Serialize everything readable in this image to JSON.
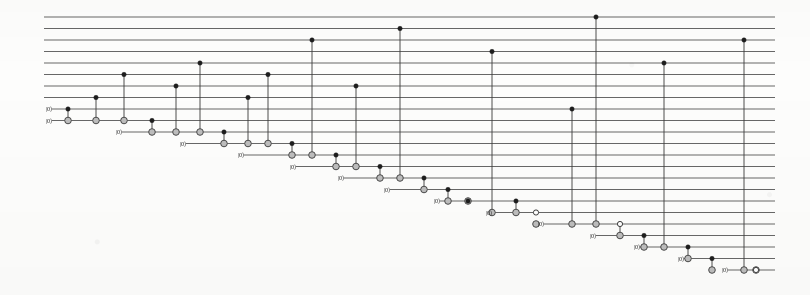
{
  "figure": {
    "kind": "quantum-circuit-diagram",
    "title": "",
    "background_color": "#fdfdfc",
    "ink_color": "#3a3a3a",
    "wire_color": "#4c4c4c",
    "target_fill": "#bdbdbd",
    "control_fill": "#1d1d1d"
  },
  "layout": {
    "width": 810,
    "height": 295,
    "wire_count": 23,
    "wire_x_start": 44,
    "wire_x_end": 775,
    "wire_y_top": 17,
    "wire_spacing": 11.5,
    "ket_label": "|0⟩",
    "ket_font_size": 6.2
  },
  "chart_data": {
    "type": "diagram",
    "title": "",
    "xlabel": "",
    "ylabel": "",
    "wires": [
      {
        "index": 0,
        "y": 17.0,
        "x_start": 44,
        "label": ""
      },
      {
        "index": 1,
        "y": 28.5,
        "x_start": 44,
        "label": ""
      },
      {
        "index": 2,
        "y": 40.0,
        "x_start": 44,
        "label": ""
      },
      {
        "index": 3,
        "y": 51.5,
        "x_start": 44,
        "label": ""
      },
      {
        "index": 4,
        "y": 63.0,
        "x_start": 44,
        "label": ""
      },
      {
        "index": 5,
        "y": 74.5,
        "x_start": 44,
        "label": ""
      },
      {
        "index": 6,
        "y": 86.0,
        "x_start": 44,
        "label": ""
      },
      {
        "index": 7,
        "y": 97.5,
        "x_start": 44,
        "label": ""
      },
      {
        "index": 8,
        "y": 109.0,
        "x_start": 52,
        "label": "|0⟩"
      },
      {
        "index": 9,
        "y": 120.5,
        "x_start": 52,
        "label": "|0⟩"
      },
      {
        "index": 10,
        "y": 132.0,
        "x_start": 122,
        "label": "|0⟩"
      },
      {
        "index": 11,
        "y": 143.5,
        "x_start": 186,
        "label": "|0⟩"
      },
      {
        "index": 12,
        "y": 155.0,
        "x_start": 244,
        "label": "|0⟩"
      },
      {
        "index": 13,
        "y": 166.5,
        "x_start": 296,
        "label": "|0⟩"
      },
      {
        "index": 14,
        "y": 178.0,
        "x_start": 344,
        "label": "|0⟩"
      },
      {
        "index": 15,
        "y": 189.5,
        "x_start": 390,
        "label": "|0⟩"
      },
      {
        "index": 16,
        "y": 201.0,
        "x_start": 440,
        "label": "|0⟩"
      },
      {
        "index": 17,
        "y": 212.5,
        "x_start": 492,
        "label": "|0⟩"
      },
      {
        "index": 18,
        "y": 224.0,
        "x_start": 544,
        "label": "|0⟩"
      },
      {
        "index": 19,
        "y": 235.5,
        "x_start": 596,
        "label": "|0⟩"
      },
      {
        "index": 20,
        "y": 247.0,
        "x_start": 640,
        "label": "|0⟩"
      },
      {
        "index": 21,
        "y": 258.5,
        "x_start": 684,
        "label": "|0⟩"
      },
      {
        "index": 22,
        "y": 270.0,
        "x_start": 728,
        "label": "|0⟩"
      }
    ],
    "gates": [
      {
        "x": 68,
        "controls": [
          {
            "wire": 8,
            "type": "filled"
          }
        ],
        "target": 9
      },
      {
        "x": 96,
        "controls": [
          {
            "wire": 7,
            "type": "filled"
          }
        ],
        "target": 9
      },
      {
        "x": 124,
        "controls": [
          {
            "wire": 5,
            "type": "filled"
          }
        ],
        "target": 9
      },
      {
        "x": 152,
        "controls": [
          {
            "wire": 9,
            "type": "filled"
          }
        ],
        "target": 10
      },
      {
        "x": 176,
        "controls": [
          {
            "wire": 6,
            "type": "filled"
          }
        ],
        "target": 10
      },
      {
        "x": 200,
        "controls": [
          {
            "wire": 4,
            "type": "filled"
          }
        ],
        "target": 10
      },
      {
        "x": 224,
        "controls": [
          {
            "wire": 10,
            "type": "filled"
          }
        ],
        "target": 11
      },
      {
        "x": 248,
        "controls": [
          {
            "wire": 7,
            "type": "filled"
          }
        ],
        "target": 11
      },
      {
        "x": 268,
        "controls": [
          {
            "wire": 5,
            "type": "filled"
          }
        ],
        "target": 11
      },
      {
        "x": 292,
        "controls": [
          {
            "wire": 11,
            "type": "filled"
          }
        ],
        "target": 12
      },
      {
        "x": 312,
        "controls": [
          {
            "wire": 2,
            "type": "filled"
          }
        ],
        "target": 12
      },
      {
        "x": 336,
        "controls": [
          {
            "wire": 12,
            "type": "filled"
          }
        ],
        "target": 13
      },
      {
        "x": 356,
        "controls": [
          {
            "wire": 6,
            "type": "filled"
          }
        ],
        "target": 13
      },
      {
        "x": 380,
        "controls": [
          {
            "wire": 13,
            "type": "filled"
          }
        ],
        "target": 14
      },
      {
        "x": 400,
        "controls": [
          {
            "wire": 1,
            "type": "filled"
          }
        ],
        "target": 14
      },
      {
        "x": 424,
        "controls": [
          {
            "wire": 14,
            "type": "filled"
          }
        ],
        "target": 15
      },
      {
        "x": 448,
        "controls": [
          {
            "wire": 15,
            "type": "filled"
          }
        ],
        "target": 16
      },
      {
        "x": 468,
        "controls": [
          {
            "wire": 16,
            "type": "filled"
          }
        ],
        "target": 16
      },
      {
        "x": 492,
        "controls": [
          {
            "wire": 3,
            "type": "filled"
          }
        ],
        "target": 17
      },
      {
        "x": 516,
        "controls": [
          {
            "wire": 16,
            "type": "filled"
          }
        ],
        "target": 17
      },
      {
        "x": 536,
        "controls": [
          {
            "wire": 17,
            "type": "open"
          }
        ],
        "target": 17
      },
      {
        "x": 572,
        "controls": [
          {
            "wire": 8,
            "type": "filled"
          }
        ],
        "target": 18
      },
      {
        "x": 572,
        "controls": [
          {
            "wire": 18,
            "type": "filled"
          }
        ],
        "target": 18
      },
      {
        "x": 596,
        "controls": [
          {
            "wire": 0,
            "type": "filled"
          }
        ],
        "target": 18
      },
      {
        "x": 620,
        "controls": [
          {
            "wire": 18,
            "type": "open"
          }
        ],
        "target": 19
      },
      {
        "x": 644,
        "controls": [
          {
            "wire": 19,
            "type": "filled"
          }
        ],
        "target": 20
      },
      {
        "x": 664,
        "controls": [
          {
            "wire": 4,
            "type": "filled"
          }
        ],
        "target": 20
      },
      {
        "x": 688,
        "controls": [
          {
            "wire": 20,
            "type": "filled"
          }
        ],
        "target": 21
      },
      {
        "x": 712,
        "controls": [
          {
            "wire": 21,
            "type": "filled"
          }
        ],
        "target": 22
      },
      {
        "x": 744,
        "controls": [
          {
            "wire": 2,
            "type": "filled"
          }
        ],
        "target": 22
      },
      {
        "x": 756,
        "controls": [
          {
            "wire": 22,
            "type": "open"
          }
        ],
        "target": 22
      }
    ],
    "gate_columns": [
      {
        "x": 68,
        "top_wire": 8,
        "bottom_wire": 9
      },
      {
        "x": 96,
        "top_wire": 7,
        "bottom_wire": 9
      },
      {
        "x": 124,
        "top_wire": 5,
        "bottom_wire": 9
      },
      {
        "x": 152,
        "top_wire": 9,
        "bottom_wire": 10
      },
      {
        "x": 176,
        "top_wire": 6,
        "bottom_wire": 10
      },
      {
        "x": 200,
        "top_wire": 4,
        "bottom_wire": 10
      },
      {
        "x": 224,
        "top_wire": 10,
        "bottom_wire": 11
      },
      {
        "x": 248,
        "top_wire": 7,
        "bottom_wire": 11
      },
      {
        "x": 268,
        "top_wire": 5,
        "bottom_wire": 11
      },
      {
        "x": 292,
        "top_wire": 11,
        "bottom_wire": 12
      },
      {
        "x": 312,
        "top_wire": 2,
        "bottom_wire": 12
      },
      {
        "x": 336,
        "top_wire": 12,
        "bottom_wire": 13
      },
      {
        "x": 356,
        "top_wire": 6,
        "bottom_wire": 13
      },
      {
        "x": 380,
        "top_wire": 13,
        "bottom_wire": 14
      },
      {
        "x": 400,
        "top_wire": 1,
        "bottom_wire": 14
      },
      {
        "x": 424,
        "top_wire": 14,
        "bottom_wire": 15
      },
      {
        "x": 448,
        "top_wire": 15,
        "bottom_wire": 16
      },
      {
        "x": 468,
        "top_wire": 16,
        "bottom_wire": 16
      },
      {
        "x": 492,
        "top_wire": 3,
        "bottom_wire": 17
      },
      {
        "x": 516,
        "top_wire": 16,
        "bottom_wire": 17
      },
      {
        "x": 536,
        "top_wire": 17,
        "bottom_wire": 17
      },
      {
        "x": 572,
        "top_wire": 8,
        "bottom_wire": 18
      },
      {
        "x": 596,
        "top_wire": 0,
        "bottom_wire": 18
      },
      {
        "x": 620,
        "top_wire": 18,
        "bottom_wire": 19
      },
      {
        "x": 644,
        "top_wire": 19,
        "bottom_wire": 20
      },
      {
        "x": 664,
        "top_wire": 4,
        "bottom_wire": 20
      },
      {
        "x": 688,
        "top_wire": 20,
        "bottom_wire": 21
      },
      {
        "x": 712,
        "top_wire": 21,
        "bottom_wire": 22
      },
      {
        "x": 744,
        "top_wire": 2,
        "bottom_wire": 22
      },
      {
        "x": 756,
        "top_wire": 22,
        "bottom_wire": 22
      }
    ],
    "controls_filled": [
      {
        "x": 68,
        "wire": 8
      },
      {
        "x": 96,
        "wire": 7
      },
      {
        "x": 124,
        "wire": 5
      },
      {
        "x": 152,
        "wire": 9
      },
      {
        "x": 176,
        "wire": 6
      },
      {
        "x": 200,
        "wire": 4
      },
      {
        "x": 224,
        "wire": 10
      },
      {
        "x": 248,
        "wire": 7
      },
      {
        "x": 268,
        "wire": 5
      },
      {
        "x": 292,
        "wire": 11
      },
      {
        "x": 312,
        "wire": 2
      },
      {
        "x": 336,
        "wire": 12
      },
      {
        "x": 356,
        "wire": 6
      },
      {
        "x": 380,
        "wire": 13
      },
      {
        "x": 400,
        "wire": 1
      },
      {
        "x": 424,
        "wire": 14
      },
      {
        "x": 448,
        "wire": 15
      },
      {
        "x": 492,
        "wire": 3
      },
      {
        "x": 516,
        "wire": 16
      },
      {
        "x": 572,
        "wire": 8
      },
      {
        "x": 596,
        "wire": 0
      },
      {
        "x": 620,
        "wire": 18
      },
      {
        "x": 644,
        "wire": 19
      },
      {
        "x": 664,
        "wire": 4
      },
      {
        "x": 688,
        "wire": 20
      },
      {
        "x": 712,
        "wire": 21
      },
      {
        "x": 744,
        "wire": 2
      },
      {
        "x": 536,
        "wire": 17
      },
      {
        "x": 468,
        "wire": 16
      }
    ],
    "controls_open": [
      {
        "x": 536,
        "wire": 17
      },
      {
        "x": 620,
        "wire": 18
      },
      {
        "x": 756,
        "wire": 22
      }
    ],
    "targets": [
      {
        "x": 68,
        "wire": 9
      },
      {
        "x": 96,
        "wire": 9
      },
      {
        "x": 124,
        "wire": 9
      },
      {
        "x": 152,
        "wire": 10
      },
      {
        "x": 176,
        "wire": 10
      },
      {
        "x": 200,
        "wire": 10
      },
      {
        "x": 224,
        "wire": 11
      },
      {
        "x": 248,
        "wire": 11
      },
      {
        "x": 268,
        "wire": 11
      },
      {
        "x": 292,
        "wire": 12
      },
      {
        "x": 312,
        "wire": 12
      },
      {
        "x": 336,
        "wire": 13
      },
      {
        "x": 356,
        "wire": 13
      },
      {
        "x": 380,
        "wire": 14
      },
      {
        "x": 400,
        "wire": 14
      },
      {
        "x": 424,
        "wire": 15
      },
      {
        "x": 448,
        "wire": 16
      },
      {
        "x": 468,
        "wire": 16
      },
      {
        "x": 492,
        "wire": 17
      },
      {
        "x": 516,
        "wire": 17
      },
      {
        "x": 536,
        "wire": 18
      },
      {
        "x": 572,
        "wire": 18
      },
      {
        "x": 596,
        "wire": 18
      },
      {
        "x": 620,
        "wire": 19
      },
      {
        "x": 644,
        "wire": 20
      },
      {
        "x": 664,
        "wire": 20
      },
      {
        "x": 688,
        "wire": 21
      },
      {
        "x": 712,
        "wire": 22
      },
      {
        "x": 744,
        "wire": 22
      },
      {
        "x": 756,
        "wire": 22
      }
    ]
  }
}
